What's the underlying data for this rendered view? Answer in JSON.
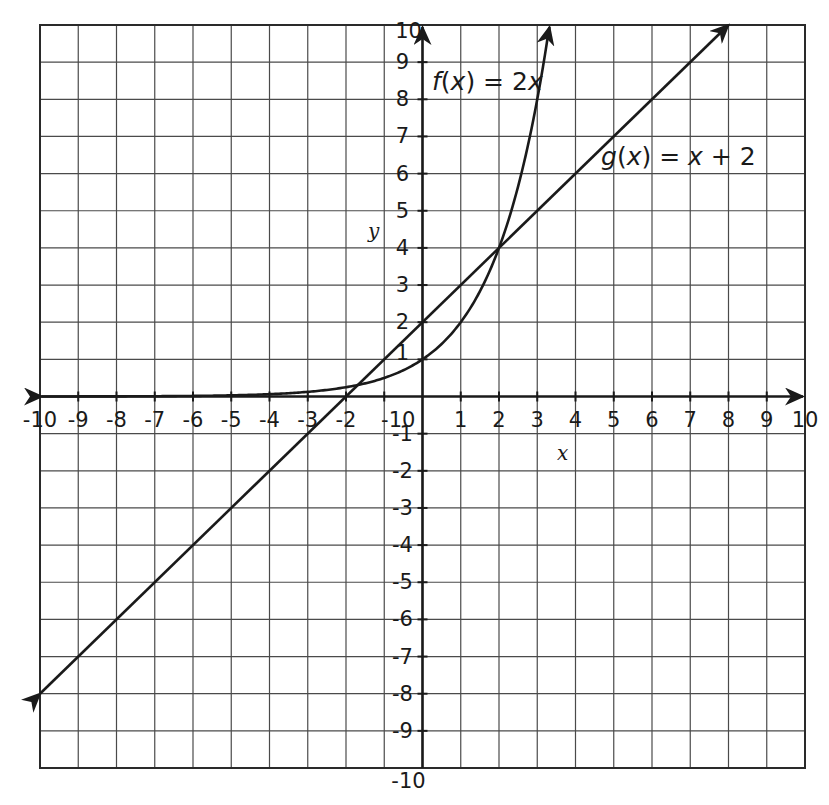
{
  "chart_data": {
    "type": "line",
    "title": "",
    "xlabel": "x",
    "ylabel": "y",
    "xlim": [
      -10,
      10
    ],
    "ylim": [
      -10,
      10
    ],
    "grid": true,
    "x_tick_labels": [
      "-10",
      "-9",
      "-8",
      "-7",
      "-6",
      "-5",
      "-4",
      "-3",
      "-2",
      "-10",
      "1",
      "2",
      "3",
      "4",
      "5",
      "6",
      "7",
      "8",
      "9",
      "10"
    ],
    "y_tick_labels": [
      "10",
      "9",
      "8",
      "7",
      "6",
      "5",
      "4",
      "3",
      "2",
      "1",
      "-1",
      "-2",
      "-3",
      "-4",
      "-5",
      "-6",
      "-7",
      "-8",
      "-9",
      "-10"
    ],
    "series": [
      {
        "name": "f(x) = 2x",
        "label_parts": [
          "f",
          "(",
          "x",
          ") = 2",
          "x"
        ],
        "function": "2^x",
        "x": [
          -10,
          -8,
          -6,
          -4,
          -3,
          -2,
          -1,
          0,
          1,
          2,
          3,
          3.32
        ],
        "y": [
          0.001,
          0.004,
          0.016,
          0.0625,
          0.125,
          0.25,
          0.5,
          1,
          2,
          4,
          8,
          10
        ],
        "end_arrow": "up"
      },
      {
        "name": "g(x) = x + 2",
        "label_parts": [
          "g",
          "(",
          "x",
          ") = ",
          "x",
          " + 2"
        ],
        "function": "x+2",
        "x": [
          -10,
          8
        ],
        "y": [
          -8,
          10
        ],
        "end_arrow": "both"
      }
    ],
    "annotations": [
      {
        "text": "f(x) = 2x",
        "x": 0.2,
        "y": 8.5
      },
      {
        "text": "g(x) = x + 2",
        "x": 4.7,
        "y": 6.2
      }
    ],
    "intersections": [
      [
        2,
        4
      ],
      [
        -1.69,
        0.31
      ]
    ]
  },
  "labels": {
    "x_var": "x",
    "y_var": "y",
    "f_label": {
      "name": "f",
      "open": "(",
      "var": "x",
      "rest": ") = 2",
      "tail": "x"
    },
    "g_label": {
      "name": "g",
      "open": "(",
      "var": "x",
      "rest": ") = ",
      "var2": "x",
      "tail": " + 2"
    }
  },
  "style": {
    "line_color": "#1a1a1a",
    "grid_color": "#4a4a4a",
    "background": "#ffffff"
  }
}
